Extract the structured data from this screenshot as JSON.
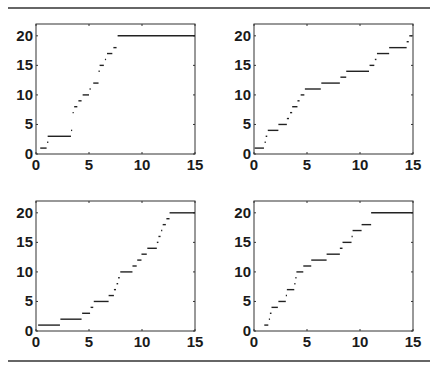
{
  "figure": {
    "rule_color": "#333333",
    "line_color": "#222222"
  },
  "chart_data": [
    {
      "type": "line",
      "title": "",
      "xlabel": "",
      "ylabel": "",
      "xlim": [
        0,
        15
      ],
      "ylim": [
        0,
        22
      ],
      "xticks": [
        0,
        5,
        10,
        15
      ],
      "yticks": [
        0,
        5,
        10,
        15,
        20
      ],
      "grid": false,
      "legend": null,
      "style": "horizontal step segments",
      "steps": [
        {
          "y": 1,
          "x0": 0.4,
          "x1": 1.0
        },
        {
          "y": 2,
          "x0": 1.05,
          "x1": 1.1
        },
        {
          "y": 3,
          "x0": 1.1,
          "x1": 3.3
        },
        {
          "y": 4,
          "x0": 3.3,
          "x1": 3.35
        },
        {
          "y": 7,
          "x0": 3.45,
          "x1": 3.5
        },
        {
          "y": 8,
          "x0": 3.6,
          "x1": 3.9
        },
        {
          "y": 9,
          "x0": 4.0,
          "x1": 4.3
        },
        {
          "y": 10,
          "x0": 4.4,
          "x1": 5.0
        },
        {
          "y": 11,
          "x0": 5.05,
          "x1": 5.15
        },
        {
          "y": 12,
          "x0": 5.4,
          "x1": 5.9
        },
        {
          "y": 14,
          "x0": 5.9,
          "x1": 5.95
        },
        {
          "y": 15,
          "x0": 6.0,
          "x1": 6.4
        },
        {
          "y": 16,
          "x0": 6.5,
          "x1": 6.55
        },
        {
          "y": 17,
          "x0": 6.7,
          "x1": 7.2
        },
        {
          "y": 18,
          "x0": 7.3,
          "x1": 7.6
        },
        {
          "y": 20,
          "x0": 7.7,
          "x1": 15.0
        }
      ]
    },
    {
      "type": "line",
      "title": "",
      "xlabel": "",
      "ylabel": "",
      "xlim": [
        0,
        15
      ],
      "ylim": [
        0,
        22
      ],
      "xticks": [
        0,
        5,
        10,
        15
      ],
      "yticks": [
        0,
        5,
        10,
        15,
        20
      ],
      "grid": false,
      "legend": null,
      "style": "horizontal step segments",
      "steps": [
        {
          "y": 1,
          "x0": 0.06,
          "x1": 0.94
        },
        {
          "y": 2,
          "x0": 1.0,
          "x1": 1.05
        },
        {
          "y": 3,
          "x0": 1.1,
          "x1": 1.25
        },
        {
          "y": 4,
          "x0": 1.3,
          "x1": 2.3
        },
        {
          "y": 5,
          "x0": 2.3,
          "x1": 3.1
        },
        {
          "y": 6,
          "x0": 3.1,
          "x1": 3.3
        },
        {
          "y": 7,
          "x0": 3.4,
          "x1": 3.6
        },
        {
          "y": 8,
          "x0": 3.6,
          "x1": 4.1
        },
        {
          "y": 9,
          "x0": 4.1,
          "x1": 4.3
        },
        {
          "y": 10,
          "x0": 4.4,
          "x1": 4.75
        },
        {
          "y": 11,
          "x0": 4.8,
          "x1": 6.3
        },
        {
          "y": 12,
          "x0": 6.35,
          "x1": 8.1
        },
        {
          "y": 13,
          "x0": 8.15,
          "x1": 8.7
        },
        {
          "y": 14,
          "x0": 8.7,
          "x1": 10.85
        },
        {
          "y": 15,
          "x0": 10.9,
          "x1": 11.35
        },
        {
          "y": 16,
          "x0": 11.4,
          "x1": 11.55
        },
        {
          "y": 17,
          "x0": 11.6,
          "x1": 12.75
        },
        {
          "y": 18,
          "x0": 12.75,
          "x1": 14.4
        },
        {
          "y": 19,
          "x0": 14.4,
          "x1": 14.6
        },
        {
          "y": 20,
          "x0": 14.65,
          "x1": 14.9
        }
      ]
    },
    {
      "type": "line",
      "title": "",
      "xlabel": "",
      "ylabel": "",
      "xlim": [
        0,
        15
      ],
      "ylim": [
        0,
        22
      ],
      "xticks": [
        0,
        5,
        10,
        15
      ],
      "yticks": [
        0,
        5,
        10,
        15,
        20
      ],
      "grid": false,
      "legend": null,
      "style": "horizontal step segments",
      "steps": [
        {
          "y": 1,
          "x0": 0.2,
          "x1": 2.26
        },
        {
          "y": 2,
          "x0": 2.3,
          "x1": 4.3
        },
        {
          "y": 3,
          "x0": 4.35,
          "x1": 5.1
        },
        {
          "y": 4,
          "x0": 5.15,
          "x1": 5.4
        },
        {
          "y": 5,
          "x0": 5.45,
          "x1": 6.85
        },
        {
          "y": 6,
          "x0": 6.85,
          "x1": 7.35
        },
        {
          "y": 7,
          "x0": 7.35,
          "x1": 7.55
        },
        {
          "y": 8,
          "x0": 7.6,
          "x1": 7.75
        },
        {
          "y": 9,
          "x0": 7.75,
          "x1": 7.9
        },
        {
          "y": 10,
          "x0": 7.95,
          "x1": 9.1
        },
        {
          "y": 11,
          "x0": 9.1,
          "x1": 9.5
        },
        {
          "y": 12,
          "x0": 9.55,
          "x1": 9.95
        },
        {
          "y": 13,
          "x0": 9.95,
          "x1": 10.45
        },
        {
          "y": 14,
          "x0": 10.5,
          "x1": 11.4
        },
        {
          "y": 15,
          "x0": 11.4,
          "x1": 11.55
        },
        {
          "y": 16,
          "x0": 11.55,
          "x1": 11.75
        },
        {
          "y": 17,
          "x0": 11.8,
          "x1": 11.9
        },
        {
          "y": 18,
          "x0": 11.95,
          "x1": 12.25
        },
        {
          "y": 19,
          "x0": 12.3,
          "x1": 12.6
        },
        {
          "y": 20,
          "x0": 12.6,
          "x1": 15.0
        }
      ]
    },
    {
      "type": "line",
      "title": "",
      "xlabel": "",
      "ylabel": "",
      "xlim": [
        0,
        15
      ],
      "ylim": [
        0,
        22
      ],
      "xticks": [
        0,
        5,
        10,
        15
      ],
      "yticks": [
        0,
        5,
        10,
        15,
        20
      ],
      "grid": false,
      "legend": null,
      "style": "horizontal step segments",
      "steps": [
        {
          "y": 1,
          "x0": 0.97,
          "x1": 1.35
        },
        {
          "y": 2,
          "x0": 1.4,
          "x1": 1.5
        },
        {
          "y": 3,
          "x0": 1.5,
          "x1": 1.65
        },
        {
          "y": 4,
          "x0": 1.65,
          "x1": 2.25
        },
        {
          "y": 5,
          "x0": 2.3,
          "x1": 3.0
        },
        {
          "y": 6,
          "x0": 3.0,
          "x1": 3.1
        },
        {
          "y": 7,
          "x0": 3.1,
          "x1": 3.8
        },
        {
          "y": 8,
          "x0": 3.8,
          "x1": 3.9
        },
        {
          "y": 9,
          "x0": 3.9,
          "x1": 4.0
        },
        {
          "y": 10,
          "x0": 4.0,
          "x1": 4.65
        },
        {
          "y": 11,
          "x0": 4.65,
          "x1": 5.4
        },
        {
          "y": 12,
          "x0": 5.4,
          "x1": 6.85
        },
        {
          "y": 13,
          "x0": 6.85,
          "x1": 8.1
        },
        {
          "y": 14,
          "x0": 8.1,
          "x1": 8.35
        },
        {
          "y": 15,
          "x0": 8.35,
          "x1": 9.2
        },
        {
          "y": 16,
          "x0": 9.2,
          "x1": 9.3
        },
        {
          "y": 17,
          "x0": 9.3,
          "x1": 10.15
        },
        {
          "y": 18,
          "x0": 10.15,
          "x1": 11.05
        },
        {
          "y": 20,
          "x0": 11.05,
          "x1": 15.0
        }
      ]
    }
  ]
}
